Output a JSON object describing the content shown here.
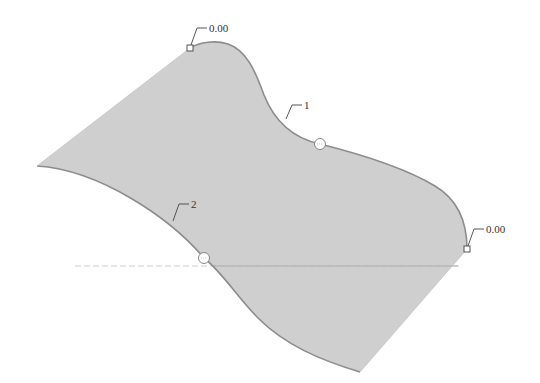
{
  "diagram": {
    "type": "surface-boundary-blend",
    "colors": {
      "surface_fill": "#cfcfcf",
      "edge": "#8c8c8c",
      "leader": "#444444",
      "text": "#333333",
      "handle_fill": "#ffffff"
    },
    "labels": {
      "top_handle_value": "0.00",
      "right_handle_value": "0.00",
      "curve_1": "1",
      "curve_2": "2"
    },
    "handles": [
      {
        "id": "top-square-handle",
        "shape": "square",
        "x": 190,
        "y": 48,
        "value": "0.00"
      },
      {
        "id": "right-square-handle",
        "shape": "square",
        "x": 467,
        "y": 249,
        "value": "0.00"
      },
      {
        "id": "curve1-circle-handle",
        "shape": "circle",
        "x": 320,
        "y": 144
      },
      {
        "id": "curve2-circle-handle",
        "shape": "circle",
        "x": 204,
        "y": 258
      }
    ],
    "callouts": [
      {
        "text": "1",
        "curve": "upper boundary curve"
      },
      {
        "text": "2",
        "curve": "lower boundary curve"
      }
    ]
  }
}
